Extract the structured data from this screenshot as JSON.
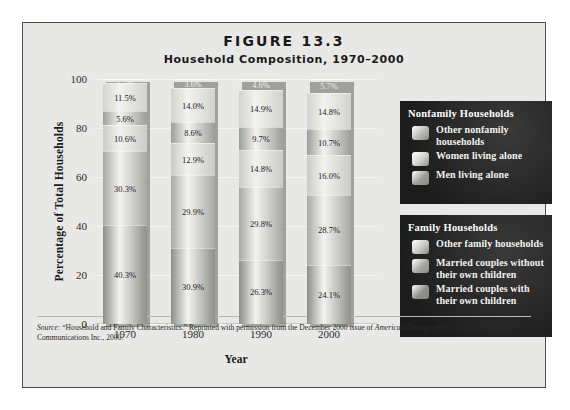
{
  "figure": {
    "title": "FIGURE 13.3",
    "subtitle": "Household Composition, 1970–2000"
  },
  "axes": {
    "ylabel": "Percentage of Total Households",
    "xlabel": "Year",
    "yticks": [
      "100",
      "80",
      "60",
      "40",
      "20",
      "0"
    ]
  },
  "legend": {
    "nonfamily": {
      "title": "Nonfamily Households",
      "items": [
        {
          "label": "Other nonfamily households",
          "color": "#b9b9b6"
        },
        {
          "label": "Women living alone",
          "color": "#d2d2cf"
        },
        {
          "label": "Men living alone",
          "color": "#9d9d9a"
        }
      ]
    },
    "family": {
      "title": "Family Households",
      "items": [
        {
          "label": "Other family households",
          "color": "#cacac7"
        },
        {
          "label": "Married couples without their own children",
          "color": "#a8a8a5"
        },
        {
          "label": "Married couples with their own children",
          "color": "#8e8e8b"
        }
      ]
    }
  },
  "source": {
    "prefix": "Source:",
    "line1": " “Household and Family Characteristics.” Reprinted with permission from the December 2000 issue of ",
    "italic1": "American Demographics",
    "line2": ". Copyright, Crain Communications Inc., 2000."
  },
  "chart_data": {
    "type": "bar",
    "subtype": "stacked-vertical-percent",
    "title": "Household Composition, 1970–2000",
    "xlabel": "Year",
    "ylabel": "Percentage of Total Households",
    "ylim": [
      0,
      100
    ],
    "ytick_step": 20,
    "grid": false,
    "legend_position": "right",
    "categories": [
      "1970",
      "1980",
      "1990",
      "2000"
    ],
    "series": [
      {
        "name": "Married couples with their own children",
        "group": "Family Households",
        "color": "#8e8e8b",
        "stack_order": 0,
        "values": [
          40.3,
          30.9,
          26.3,
          24.1
        ],
        "labels": [
          "40.3%",
          "30.9%",
          "26.3%",
          "24.1%"
        ]
      },
      {
        "name": "Married couples without their own children",
        "group": "Family Households",
        "color": "#a8a8a5",
        "stack_order": 1,
        "values": [
          30.3,
          29.9,
          29.8,
          28.7
        ],
        "labels": [
          "30.3%",
          "29.9%",
          "29.8%",
          "28.7%"
        ]
      },
      {
        "name": "Other family households",
        "group": "Family Households",
        "color": "#cacac7",
        "stack_order": 2,
        "values": [
          10.6,
          12.9,
          14.8,
          16.0
        ],
        "labels": [
          "10.6%",
          "12.9%",
          "14.8%",
          "16.0%"
        ]
      },
      {
        "name": "Men living alone",
        "group": "Nonfamily Households",
        "color": "#9d9d9a",
        "stack_order": 3,
        "values": [
          5.6,
          8.6,
          9.7,
          10.7
        ],
        "labels": [
          "5.6%",
          "8.6%",
          "9.7%",
          "10.7%"
        ]
      },
      {
        "name": "Women living alone",
        "group": "Nonfamily Households",
        "color": "#d2d2cf",
        "stack_order": 4,
        "values": [
          11.5,
          14.0,
          14.9,
          14.8
        ],
        "labels": [
          "11.5%",
          "14.0%",
          "14.9%",
          "14.8%"
        ]
      },
      {
        "name": "Other nonfamily households",
        "group": "Nonfamily Households",
        "color": "#3a3a38",
        "stack_order": 5,
        "values": [
          1.7,
          3.6,
          4.6,
          5.7
        ],
        "labels": [
          "1.7%",
          "3.6%",
          "4.6%",
          "5.7%"
        ]
      }
    ]
  }
}
